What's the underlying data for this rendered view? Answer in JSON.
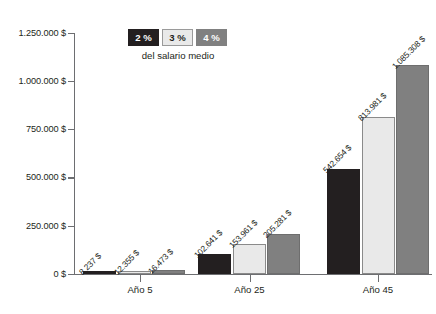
{
  "chart_data": {
    "type": "bar",
    "title": "",
    "xlabel": "",
    "ylabel": "",
    "categories": [
      "Año 5",
      "Año 25",
      "Año 45"
    ],
    "series": [
      {
        "name": "2 %",
        "color": "#231f20",
        "values": [
          8237,
          12355,
          16473
        ],
        "value_labels": [
          "8.237 $",
          "12.355 $",
          "16.473 $"
        ]
      },
      {
        "name": "3 %",
        "color": "#e9e9e9",
        "values": [
          102641,
          153961,
          205281
        ],
        "value_labels": [
          "102.641 $",
          "153.961 $",
          "205.281 $"
        ]
      },
      {
        "name": "4 %",
        "color": "#808080",
        "values": [
          542654,
          813981,
          1085308
        ],
        "value_labels": [
          "542.654 $",
          "813.981 $",
          "1.085.308 $"
        ]
      }
    ],
    "group_values": [
      [
        8237,
        12355,
        16473
      ],
      [
        102641,
        153961,
        205281
      ],
      [
        542654,
        813981,
        1085308
      ]
    ],
    "group_value_labels": [
      [
        "8.237 $",
        "12.355 $",
        "16.473 $"
      ],
      [
        "102.641 $",
        "153.961 $",
        "205.281 $"
      ],
      [
        "542.654 $",
        "813.981 $",
        "1.085.308 $"
      ]
    ],
    "ylim": [
      0,
      1250000
    ],
    "yticks": [
      0,
      250000,
      500000,
      750000,
      1000000,
      1250000
    ],
    "ytick_labels": [
      "0 $",
      "250.000 $",
      "500.000 $",
      "750.000 $",
      "1.000.000 $",
      "1.250.000 $"
    ],
    "grid": false,
    "legend_position": "top-center"
  },
  "legend": {
    "items": [
      {
        "label": "2 %"
      },
      {
        "label": "3 %"
      },
      {
        "label": "4 %"
      }
    ],
    "caption": "del salario medio"
  }
}
